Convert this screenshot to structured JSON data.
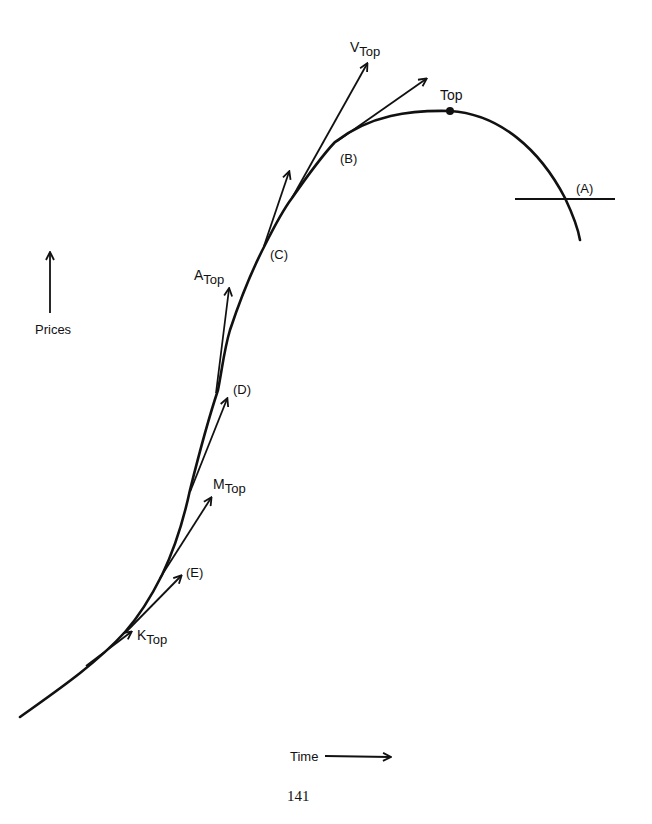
{
  "diagram": {
    "title": "",
    "curve_description": "S-shaped price curve rising over time, peaking at Top, then falling below line (A)",
    "stroke_color": "#111111",
    "background": "#ffffff",
    "labels": {
      "top": "Top",
      "v_top": {
        "prefix": "V",
        "suffix": "Top"
      },
      "a_top": {
        "prefix": "A",
        "suffix": "Top"
      },
      "m_top": {
        "prefix": "M",
        "suffix": "Top"
      },
      "k_top": {
        "prefix": "K",
        "suffix": "Top"
      },
      "point_a": "(A)",
      "point_b": "(B)",
      "point_c": "(C)",
      "point_d": "(D)",
      "point_e": "(E)"
    },
    "axes": {
      "y_label": "Prices",
      "x_label": "Time"
    },
    "page_number": "141"
  }
}
